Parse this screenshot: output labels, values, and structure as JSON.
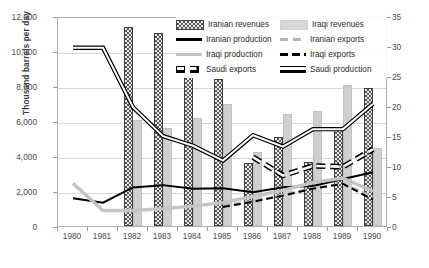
{
  "chart_data": {
    "type": "line",
    "title": "",
    "xlabel": "",
    "ylabel": "Thousand  barrels per day",
    "y2label": "",
    "categories": [
      "1980",
      "1981",
      "1982",
      "1983",
      "1984",
      "1985",
      "1986",
      "1987",
      "1988",
      "1989",
      "1990"
    ],
    "ylim": [
      0,
      12000
    ],
    "y2lim": [
      0,
      35
    ],
    "yticks": [
      "0",
      "2,000",
      "4,000",
      "6,000",
      "8,000",
      "10,000",
      "12,000"
    ],
    "ytick_values": [
      0,
      2000,
      4000,
      6000,
      8000,
      10000,
      12000
    ],
    "y2ticks": [
      "0",
      "5",
      "10",
      "15",
      "20",
      "25",
      "30",
      "35"
    ],
    "y2tick_values": [
      0,
      5,
      10,
      15,
      20,
      25,
      30,
      35
    ],
    "grid": true,
    "legend_position": "top-right-inside",
    "series": [
      {
        "name": "Iranian revenues",
        "kind": "bar",
        "axis": "right",
        "color": "#595959",
        "pattern": "dotted-dark",
        "values": [
          null,
          null,
          33.0,
          32.2,
          25.2,
          24.5,
          10.5,
          14.9,
          10.6,
          16.2,
          23.0
        ],
        "values_left_scale": [
          null,
          null,
          11350,
          11050,
          8650,
          8400,
          3600,
          5100,
          3630,
          5550,
          7880
        ]
      },
      {
        "name": "Iraqi revenues",
        "kind": "bar",
        "axis": "right",
        "color": "#cfcfcf",
        "pattern": "solid-light",
        "values": [
          null,
          null,
          17.6,
          16.3,
          18.1,
          20.4,
          12.4,
          18.6,
          19.1,
          23.5,
          13.0
        ],
        "values_left_scale": [
          null,
          null,
          6050,
          5600,
          6200,
          7000,
          4250,
          6380,
          6550,
          8050,
          4450
        ]
      },
      {
        "name": "Iranian production",
        "kind": "line",
        "axis": "left",
        "color": "#000000",
        "style": "solid",
        "values": [
          1700,
          1450,
          2320,
          2450,
          2250,
          2270,
          2050,
          2330,
          2400,
          2800,
          3180
        ]
      },
      {
        "name": "Iranian exports",
        "kind": "line",
        "axis": "left",
        "color": "#b5b5b5",
        "style": "dashed",
        "values": [
          null,
          null,
          null,
          null,
          null,
          1300,
          1550,
          1900,
          2300,
          2550,
          1800
        ]
      },
      {
        "name": "Iraqi production",
        "kind": "line",
        "axis": "left",
        "color": "#c4c4c4",
        "style": "thick-solid",
        "values": [
          2550,
          1000,
          1000,
          1100,
          1250,
          1450,
          1800,
          2150,
          2600,
          2850,
          2100
        ]
      },
      {
        "name": "Iraqi exports",
        "kind": "line",
        "axis": "left",
        "color": "#000000",
        "style": "dashed",
        "values": [
          null,
          null,
          null,
          null,
          null,
          1200,
          1500,
          1850,
          2250,
          2520,
          1620
        ]
      },
      {
        "name": "Saudi exports",
        "kind": "line",
        "axis": "left",
        "color": "#000000",
        "style": "dashed-outline",
        "values": [
          null,
          null,
          null,
          null,
          null,
          null,
          4050,
          3000,
          3550,
          3500,
          4500
        ]
      },
      {
        "name": "Saudi production",
        "kind": "line",
        "axis": "left",
        "color": "#000000",
        "style": "double-outline",
        "values": [
          10300,
          10300,
          6900,
          5250,
          4700,
          3850,
          5300,
          4650,
          5650,
          5650,
          7100
        ]
      }
    ]
  },
  "legend": {
    "items": [
      {
        "label": "Iranian revenues",
        "swatch": "sw-iran-rev",
        "type": "patch",
        "col": "a",
        "row": 0
      },
      {
        "label": "Iraqi revenues",
        "swatch": "sw-iraq-rev",
        "type": "patch",
        "col": "b",
        "row": 0
      },
      {
        "label": "Iranian production",
        "swatch": "sw-iran-prod",
        "type": "line",
        "col": "a",
        "row": 1
      },
      {
        "label": "Iranian exports",
        "swatch": "sw-iran-exp",
        "type": "line",
        "col": "b",
        "row": 1
      },
      {
        "label": "Iraqi production",
        "swatch": "sw-iraq-prod",
        "type": "line",
        "col": "a",
        "row": 2
      },
      {
        "label": "Iraqi exports",
        "swatch": "sw-iraq-exp",
        "type": "line",
        "col": "b",
        "row": 2
      },
      {
        "label": "Saudi exports",
        "swatch": "sw-saudi-exp",
        "type": "line",
        "col": "a",
        "row": 3
      },
      {
        "label": "Saudi production",
        "swatch": "sw-saudi-prod",
        "type": "line",
        "col": "b",
        "row": 3
      }
    ]
  },
  "colors": {
    "iranian_revenues": "#595959",
    "iraqi_revenues": "#cfcfcf",
    "iranian_production": "#000000",
    "iraqi_production": "#c4c4c4",
    "iranian_exports": "#b5b5b5",
    "grid": "#d6d6d6",
    "frame": "#b0b0b0",
    "text": "#4a4a4a"
  }
}
